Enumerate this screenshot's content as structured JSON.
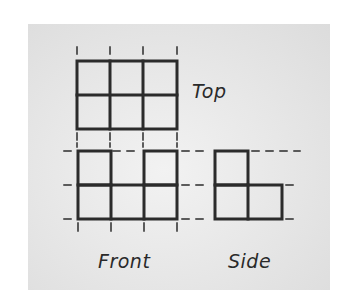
{
  "diagram": {
    "views": [
      {
        "name": "top",
        "label": "Top",
        "rows": 2,
        "cols": 3,
        "filled": [
          [
            1,
            1,
            1
          ],
          [
            1,
            1,
            1
          ]
        ]
      },
      {
        "name": "front",
        "label": "Front",
        "rows": 2,
        "cols": 3,
        "filled": [
          [
            1,
            0,
            1
          ],
          [
            1,
            1,
            1
          ]
        ]
      },
      {
        "name": "side",
        "label": "Side",
        "rows": 2,
        "cols": 2,
        "filled": [
          [
            1,
            0
          ],
          [
            1,
            1
          ]
        ]
      }
    ],
    "colors": {
      "line": "#2b2b2b",
      "background": "#e4e4e4"
    }
  }
}
